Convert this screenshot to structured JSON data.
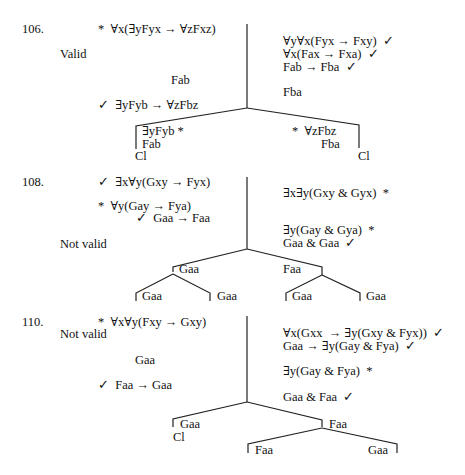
{
  "problems": [
    {
      "number": "106.",
      "verdict": "Valid",
      "left_column": [
        "*  ∀x(∃yFyx → ∀zFxz)",
        "Fab",
        "✓  ∃yFyb → ∀zFbz"
      ],
      "right_column": [
        "∀y∀x(Fyx → Fxy)  ✓",
        "∀x(Fax → Fxa)  ✓",
        "Fab → Fba  ✓",
        "Fba"
      ],
      "branches": {
        "left": [
          "∃yFyb *",
          "Fab",
          "Cl"
        ],
        "right": [
          "*  ∀zFbz",
          "Fba",
          "Cl"
        ]
      }
    },
    {
      "number": "108.",
      "verdict": "Not valid",
      "left_column": [
        "✓  ∃x∀y(Gxy → Fyx)",
        "*  ∀y(Gay → Fya)",
        "✓  Gaa → Faa"
      ],
      "right_column": [
        "∃x∃y(Gxy & Gyx)  *",
        "∃y(Gay & Gya)  *",
        "Gaa & Gaa  ✓"
      ],
      "branches": {
        "left": "Gaa",
        "right": "Faa",
        "left_children": [
          "Gaa",
          "Gaa"
        ],
        "right_children": [
          "Gaa",
          "Gaa"
        ]
      }
    },
    {
      "number": "110.",
      "verdict": "Not valid",
      "left_column": [
        "*  ∀x∀y(Fxy → Gxy)",
        "Gaa",
        "✓  Faa → Gaa"
      ],
      "right_column": [
        "∀x(Gxx  → ∃y(Gxy & Fyx))  ✓",
        "Gaa → ∃y(Gay & Fya)  ✓",
        "∃y(Gay & Fya)  *",
        "Gaa & Faa  ✓"
      ],
      "branches": {
        "left": [
          "Gaa",
          "Cl"
        ],
        "right": "Faa",
        "right_children": [
          "Faa",
          "Gaa"
        ]
      }
    }
  ]
}
